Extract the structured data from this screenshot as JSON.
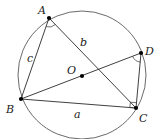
{
  "diagram": {
    "title": "",
    "circle": {
      "center": "O",
      "cx": 82,
      "cy": 75,
      "r": 64
    },
    "points": [
      {
        "name": "A",
        "x": 49,
        "y": 18,
        "label": "A",
        "lx": 38,
        "ly": 14
      },
      {
        "name": "B",
        "x": 21,
        "y": 99,
        "label": "B",
        "lx": 6,
        "ly": 113
      },
      {
        "name": "C",
        "x": 136,
        "y": 108,
        "label": "C",
        "lx": 139,
        "ly": 122
      },
      {
        "name": "D",
        "x": 141,
        "y": 53,
        "label": "D",
        "lx": 145,
        "ly": 55
      },
      {
        "name": "O",
        "x": 82,
        "y": 76,
        "label": "O",
        "lx": 67,
        "ly": 74
      }
    ],
    "segments": [
      {
        "from": "A",
        "to": "B",
        "label": "c"
      },
      {
        "from": "A",
        "to": "C",
        "label": "b"
      },
      {
        "from": "B",
        "to": "C",
        "label": "a"
      },
      {
        "from": "B",
        "to": "D",
        "label": ""
      },
      {
        "from": "D",
        "to": "C",
        "label": ""
      }
    ],
    "side_labels": [
      {
        "text": "c",
        "x": 27,
        "y": 62
      },
      {
        "text": "b",
        "x": 80,
        "y": 46
      },
      {
        "text": "a",
        "x": 74,
        "y": 118
      }
    ],
    "angle_marks": [
      {
        "at": "A",
        "type": "arc"
      },
      {
        "at": "D",
        "type": "arc"
      },
      {
        "at": "C",
        "type": "right-angle"
      }
    ]
  }
}
